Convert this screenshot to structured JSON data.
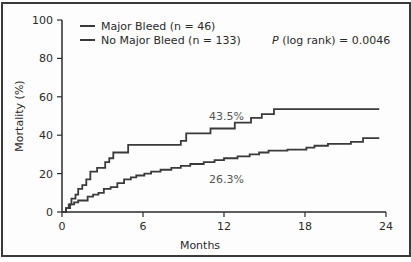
{
  "chart_data": {
    "type": "line",
    "subtype": "kaplan-meier-step",
    "title": "",
    "xlabel": "Months",
    "ylabel": "Mortality (%)",
    "xlim": [
      0,
      24
    ],
    "ylim": [
      0,
      100
    ],
    "xticks": [
      "0",
      "6",
      "12",
      "18",
      "24"
    ],
    "yticks": [
      "0",
      "20",
      "40",
      "60",
      "80",
      "100"
    ],
    "grid": false,
    "legend_position": "top-left",
    "series": [
      {
        "name": "Major Bleed (n = 46)",
        "color": "#3a3a3a",
        "steps": [
          [
            0.3,
            2
          ],
          [
            0.5,
            4
          ],
          [
            0.7,
            7
          ],
          [
            1.0,
            9
          ],
          [
            1.2,
            12
          ],
          [
            1.5,
            14
          ],
          [
            1.8,
            17
          ],
          [
            2.1,
            21
          ],
          [
            2.6,
            23
          ],
          [
            3.2,
            26
          ],
          [
            3.5,
            28
          ],
          [
            3.8,
            31
          ],
          [
            4.9,
            35
          ],
          [
            8.8,
            37
          ],
          [
            9.2,
            41
          ],
          [
            11.0,
            43.5
          ],
          [
            12.8,
            46.5
          ],
          [
            14.0,
            49
          ],
          [
            14.8,
            51
          ],
          [
            15.7,
            53.6
          ],
          [
            23.5,
            53.6
          ]
        ]
      },
      {
        "name": "No Major Bleed (n = 133)",
        "color": "#3a3a3a",
        "steps": [
          [
            0.3,
            2
          ],
          [
            0.6,
            4
          ],
          [
            0.9,
            5
          ],
          [
            1.2,
            6
          ],
          [
            1.9,
            8
          ],
          [
            2.3,
            9
          ],
          [
            2.7,
            10
          ],
          [
            3.1,
            12
          ],
          [
            3.6,
            13
          ],
          [
            4.1,
            15
          ],
          [
            4.6,
            17
          ],
          [
            5.1,
            18
          ],
          [
            5.5,
            19
          ],
          [
            6.1,
            20
          ],
          [
            6.6,
            21
          ],
          [
            7.3,
            22
          ],
          [
            8.1,
            23
          ],
          [
            8.8,
            24
          ],
          [
            9.5,
            25
          ],
          [
            10.5,
            26
          ],
          [
            11.3,
            27
          ],
          [
            12.0,
            28
          ],
          [
            13.0,
            29
          ],
          [
            13.9,
            30
          ],
          [
            14.6,
            31
          ],
          [
            15.3,
            32
          ],
          [
            16.7,
            32.5
          ],
          [
            18.1,
            33.5
          ],
          [
            18.7,
            34.5
          ],
          [
            19.7,
            35.5
          ],
          [
            21.4,
            36.5
          ],
          [
            22.3,
            38.5
          ],
          [
            23.5,
            38.5
          ]
        ]
      }
    ],
    "annotations": [
      {
        "text": "43.5%",
        "x": 11.7,
        "y": 48
      },
      {
        "text": "26.3%",
        "x": 11.7,
        "y": 19
      },
      {
        "text": "P (log rank) = 0.0046",
        "x": 18.5,
        "y": 91
      }
    ]
  },
  "legend": {
    "items": [
      "Major Bleed (n = 46)",
      "No Major Bleed (n = 133)"
    ]
  },
  "stats": {
    "p_label": "P",
    "p_rest": " (log rank) = 0.0046"
  },
  "labels": {
    "major_final": "43.5%",
    "nomajor_final": "26.3%",
    "xlabel": "Months",
    "ylabel": "Mortality (%)"
  }
}
